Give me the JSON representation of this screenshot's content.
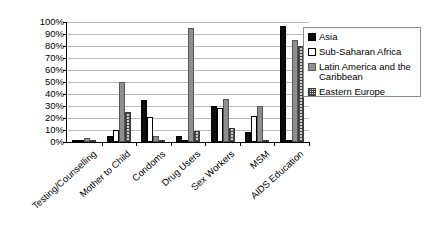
{
  "chart_data": {
    "type": "bar",
    "title": "",
    "subtitle": "",
    "xlabel": "",
    "ylabel": "",
    "ylim": [
      0,
      100
    ],
    "ytick_labels": [
      "100%",
      "90%",
      "80%",
      "70%",
      "60%",
      "50%",
      "40%",
      "30%",
      "20%",
      "10%",
      "0%"
    ],
    "ytick_values": [
      100,
      90,
      80,
      70,
      60,
      50,
      40,
      30,
      20,
      10,
      0
    ],
    "grid": true,
    "legend_position": "right",
    "value_suffix": "%",
    "categories": [
      "Testing/Counselling",
      "Mother to Child",
      "Condoms",
      "Drug Users",
      "Sex Workers",
      "MSM",
      "AIDS Education"
    ],
    "series": [
      {
        "name": "Asia",
        "color": "#0d0d0d",
        "pattern": "solid-black",
        "values": [
          1,
          5,
          35,
          5,
          30,
          8,
          97
        ]
      },
      {
        "name": "Sub-Saharan Africa",
        "color": "#ffffff",
        "pattern": "open-white",
        "values": [
          2,
          10,
          21,
          1,
          28,
          22,
          2
        ]
      },
      {
        "name": "Latin America and the Caribbean",
        "color": "#8f8f8f",
        "pattern": "solid-gray",
        "values": [
          3,
          50,
          5,
          95,
          36,
          30,
          85
        ]
      },
      {
        "name": "Eastern Europe",
        "color": "#cfcfcf",
        "pattern": "crosshatch",
        "values": [
          1,
          25,
          2,
          9,
          12,
          1,
          80
        ]
      }
    ]
  },
  "legend": {
    "items": [
      {
        "label": "Asia"
      },
      {
        "label": "Sub-Saharan Africa"
      },
      {
        "label": "Latin America and the Caribbean"
      },
      {
        "label": "Eastern Europe"
      }
    ]
  }
}
